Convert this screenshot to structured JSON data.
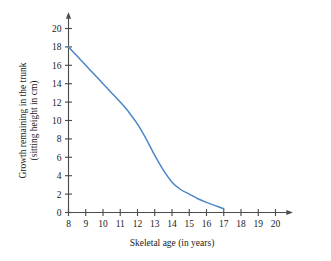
{
  "chart_data": {
    "type": "line",
    "title": "",
    "xlabel": "Skeletal age (in years)",
    "ylabel": "Growth remaining in the trunk (sitting height in cm)",
    "ylabel_line1": "Growth remaining in the trunk",
    "ylabel_line2": "(sitting height in cm)",
    "xlim": [
      8,
      20
    ],
    "ylim": [
      0,
      20
    ],
    "xticks": [
      8,
      9,
      10,
      11,
      12,
      13,
      14,
      15,
      16,
      17,
      18,
      19,
      20
    ],
    "yticks": [
      0,
      2,
      4,
      6,
      8,
      10,
      12,
      14,
      16,
      18,
      20
    ],
    "xtick_labels": [
      "8",
      "9",
      "10",
      "11",
      "12",
      "13",
      "14",
      "15",
      "16",
      "17",
      "18",
      "19",
      "20"
    ],
    "ytick_labels": [
      "0",
      "2",
      "4",
      "6",
      "8",
      "10",
      "12",
      "14",
      "16",
      "18",
      "20"
    ],
    "grid": false,
    "legend": false,
    "legend_position": "none",
    "axis_arrows": [
      "x-right",
      "y-top"
    ],
    "series": [
      {
        "name": "Growth remaining",
        "color": "#4a86c8",
        "x": [
          8,
          8.5,
          9,
          9.5,
          10,
          10.5,
          11,
          11.5,
          12,
          12.5,
          13,
          13.5,
          14,
          14.5,
          15,
          15.5,
          16,
          16.5,
          17
        ],
        "values": [
          18.0,
          17.0,
          16.0,
          15.0,
          14.0,
          13.0,
          12.0,
          10.9,
          9.6,
          8.0,
          6.2,
          4.6,
          3.3,
          2.5,
          2.0,
          1.5,
          1.1,
          0.75,
          0.4
        ]
      }
    ]
  },
  "colors": {
    "curve": "#4a86c8",
    "axis": "#4d4d4d",
    "text": "#1a1a1a",
    "background": "#ffffff"
  }
}
